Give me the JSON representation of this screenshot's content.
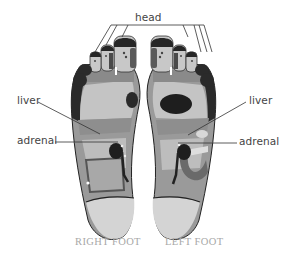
{
  "diagram": {
    "labels": {
      "head": "head",
      "liver_right": "liver",
      "liver_left": "liver",
      "adrenal_right": "adrenal",
      "adrenal_left": "adrenal"
    },
    "captions": {
      "right_foot": "RIGHT FOOT",
      "left_foot": "LEFT FOOT"
    },
    "colors": {
      "background": "#ffffff",
      "foot_light": "#c8c8c8",
      "foot_mid": "#9a9a9a",
      "foot_band": "#8a8a8a",
      "foot_dark": "#2a2a2a",
      "heel": "#d4d4d4",
      "label_text": "#444444",
      "caption_text": "#a8a8a8",
      "leader_line": "#333333"
    }
  }
}
